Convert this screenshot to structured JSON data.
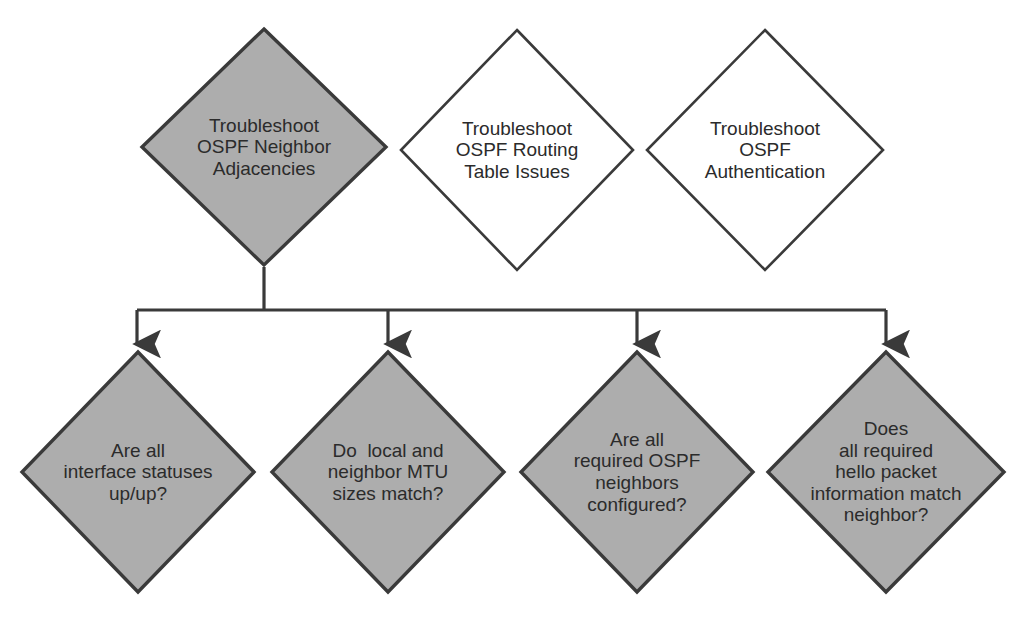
{
  "diagram": {
    "colors": {
      "shaded_fill": "#adadad",
      "plain_fill": "#ffffff",
      "stroke": "#3a3a3a",
      "text": "#2b2b2b",
      "background": "#ffffff"
    },
    "top_row": [
      {
        "id": "troubleshoot-ospf-neighbor-adjacencies",
        "name": "node-troubleshoot-ospf-neighbor-adjacencies",
        "shape": "diamond",
        "fill": "shaded",
        "cx": 264,
        "cy": 147,
        "rx": 124,
        "ry": 120,
        "font_size": 19,
        "lines": [
          "Troubleshoot",
          "OSPF Neighbor",
          "Adjacencies"
        ],
        "text": "Troubleshoot OSPF Neighbor Adjacencies"
      },
      {
        "id": "troubleshoot-ospf-routing-table-issues",
        "name": "node-troubleshoot-ospf-routing-table-issues",
        "shape": "diamond",
        "fill": "plain",
        "cx": 517,
        "cy": 150,
        "rx": 118,
        "ry": 122,
        "font_size": 19,
        "lines": [
          "Troubleshoot",
          "OSPF Routing",
          "Table Issues"
        ],
        "text": "Troubleshoot OSPF Routing Table Issues"
      },
      {
        "id": "troubleshoot-ospf-authentication",
        "name": "node-troubleshoot-ospf-authentication",
        "shape": "diamond",
        "fill": "plain",
        "cx": 765,
        "cy": 150,
        "rx": 120,
        "ry": 122,
        "font_size": 19,
        "lines": [
          "Troubleshoot",
          "OSPF",
          "Authentication"
        ],
        "text": "Troubleshoot OSPF Authentication"
      }
    ],
    "bottom_row": [
      {
        "id": "are-all-interface-statuses-up-up",
        "name": "node-are-all-interface-statuses-up-up",
        "shape": "diamond",
        "fill": "shaded",
        "cx": 138,
        "cy": 472,
        "rx": 118,
        "ry": 122,
        "font_size": 19,
        "lines": [
          "Are all",
          "interface statuses",
          "up/up?"
        ],
        "text": "Are all interface statuses up/up?"
      },
      {
        "id": "do-local-and-neighbor-mtu-sizes-match",
        "name": "node-do-local-and-neighbor-mtu-sizes-match",
        "shape": "diamond",
        "fill": "shaded",
        "cx": 388,
        "cy": 472,
        "rx": 118,
        "ry": 122,
        "font_size": 19,
        "lines": [
          "Do  local and",
          "neighbor MTU",
          "sizes match?"
        ],
        "text": "Do  local and neighbor MTU sizes match?"
      },
      {
        "id": "are-all-required-ospf-neighbors-configured",
        "name": "node-are-all-required-ospf-neighbors-configured",
        "shape": "diamond",
        "fill": "shaded",
        "cx": 637,
        "cy": 472,
        "rx": 118,
        "ry": 122,
        "font_size": 19,
        "lines": [
          "Are all",
          "required OSPF",
          "neighbors",
          "configured?"
        ],
        "text": "Are all required OSPF neighbors configured?"
      },
      {
        "id": "does-all-required-hello-packet-information-match-neighbor",
        "name": "node-does-all-required-hello-packet-information-match-neighbor",
        "shape": "diamond",
        "fill": "shaded",
        "cx": 886,
        "cy": 472,
        "rx": 120,
        "ry": 122,
        "font_size": 19,
        "lines": [
          "Does",
          "all required",
          "hello packet",
          "information match",
          "neighbor?"
        ],
        "text": "Does all required hello packet information match neighbor?"
      }
    ],
    "connectors": {
      "stem": {
        "name": "connector-stem-from-root",
        "x": 264,
        "y_from": 267,
        "y_to": 310
      },
      "bus": {
        "name": "connector-horizontal-bus",
        "y": 310,
        "x_from": 137,
        "x_to": 886
      },
      "branches": [
        {
          "name": "connector-branch-to-interface-statuses",
          "x": 137,
          "y_from": 310,
          "y_to": 348
        },
        {
          "name": "connector-branch-to-mtu-sizes",
          "x": 388,
          "y_from": 310,
          "y_to": 348
        },
        {
          "name": "connector-branch-to-ospf-neighbors",
          "x": 637,
          "y_from": 310,
          "y_to": 348
        },
        {
          "name": "connector-branch-to-hello-packet",
          "x": 886,
          "y_from": 310,
          "y_to": 348
        }
      ],
      "arrow_head": "down-arrow"
    }
  }
}
